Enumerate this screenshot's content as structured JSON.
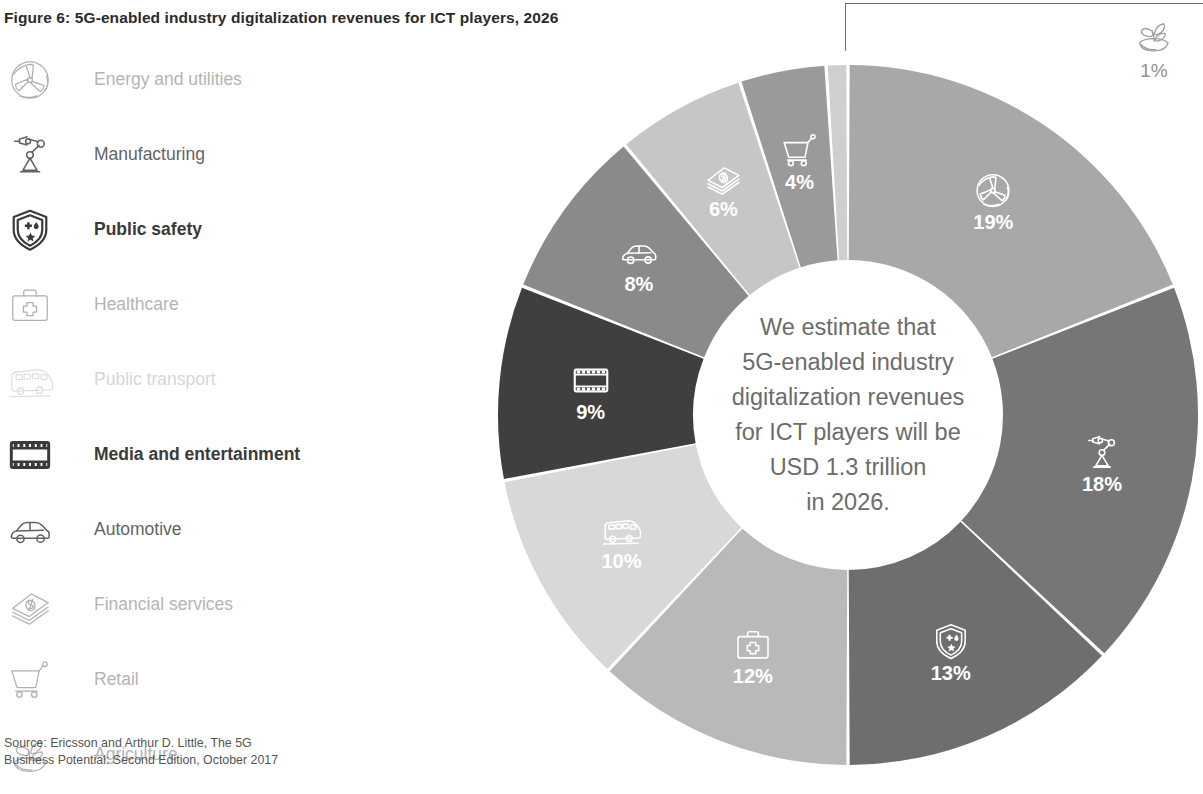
{
  "figure": {
    "title": "Figure 6: 5G-enabled industry digitalization revenues for ICT players, 2026",
    "source": "Source: Ericsson and Arthur D. Little, The 5G\nBusiness Potential: Second Edition, October 2017"
  },
  "center": {
    "line1": "We estimate that",
    "line2": "5G-enabled industry",
    "line3": "digitalization revenues",
    "line4": "for ICT players will be",
    "line5": "USD 1.3 trillion",
    "line6": "in 2026."
  },
  "legend": {
    "items": [
      {
        "label": "Energy and utilities",
        "icon": "wind-turbine-icon",
        "emphasis": "light"
      },
      {
        "label": "Manufacturing",
        "icon": "robot-arm-icon",
        "emphasis": "medium"
      },
      {
        "label": "Public safety",
        "icon": "shield-icon",
        "emphasis": "strong"
      },
      {
        "label": "Healthcare",
        "icon": "first-aid-kit-icon",
        "emphasis": "light"
      },
      {
        "label": "Public transport",
        "icon": "bus-icon",
        "emphasis": "faint"
      },
      {
        "label": "Media and entertainment",
        "icon": "film-strip-icon",
        "emphasis": "strong"
      },
      {
        "label": "Automotive",
        "icon": "car-icon",
        "emphasis": "medium"
      },
      {
        "label": "Financial services",
        "icon": "banknotes-icon",
        "emphasis": "light"
      },
      {
        "label": "Retail",
        "icon": "shopping-cart-icon",
        "emphasis": "light"
      },
      {
        "label": "Agriculture",
        "icon": "seedling-icon",
        "emphasis": "light"
      }
    ]
  },
  "chart_data": {
    "type": "pie",
    "variant": "donut",
    "title": "Figure 6: 5G-enabled industry digitalization revenues for ICT players, 2026",
    "unit": "percent",
    "total_label": "USD 1.3 trillion",
    "year": "2026",
    "start_angle_deg": 0,
    "direction": "clockwise",
    "inner_radius_ratio": 0.44,
    "legend_position": "left",
    "grid": false,
    "categories": [
      "Energy and utilities",
      "Manufacturing",
      "Public safety",
      "Healthcare",
      "Public transport",
      "Media and entertainment",
      "Automotive",
      "Financial services",
      "Retail",
      "Agriculture"
    ],
    "values": [
      19,
      18,
      13,
      12,
      10,
      9,
      8,
      6,
      4,
      1
    ],
    "labels": [
      "19%",
      "18%",
      "13%",
      "12%",
      "10%",
      "9%",
      "8%",
      "6%",
      "4%",
      "1%"
    ],
    "colors": [
      "#a8a8a8",
      "#767676",
      "#6e6e6e",
      "#b9b9b9",
      "#d8d8d8",
      "#3f3f3f",
      "#8a8a8a",
      "#c6c6c6",
      "#9a9a9a",
      "#cfcfcf"
    ],
    "icons": [
      "wind-turbine-icon",
      "robot-arm-icon",
      "shield-icon",
      "first-aid-kit-icon",
      "bus-icon",
      "film-strip-icon",
      "car-icon",
      "banknotes-icon",
      "shopping-cart-icon",
      "seedling-icon"
    ],
    "slices": [
      {
        "name": "Energy and utilities",
        "value": 19,
        "label": "19%",
        "color": "#a8a8a8",
        "icon": "wind-turbine-icon",
        "label_inside": true
      },
      {
        "name": "Manufacturing",
        "value": 18,
        "label": "18%",
        "color": "#767676",
        "icon": "robot-arm-icon",
        "label_inside": true
      },
      {
        "name": "Public safety",
        "value": 13,
        "label": "13%",
        "color": "#6e6e6e",
        "icon": "shield-icon",
        "label_inside": true
      },
      {
        "name": "Healthcare",
        "value": 12,
        "label": "12%",
        "color": "#b9b9b9",
        "icon": "first-aid-kit-icon",
        "label_inside": true
      },
      {
        "name": "Public transport",
        "value": 10,
        "label": "10%",
        "color": "#d8d8d8",
        "icon": "bus-icon",
        "label_inside": true
      },
      {
        "name": "Media and entertainment",
        "value": 9,
        "label": "9%",
        "color": "#3f3f3f",
        "icon": "film-strip-icon",
        "label_inside": true
      },
      {
        "name": "Automotive",
        "value": 8,
        "label": "8%",
        "color": "#8a8a8a",
        "icon": "car-icon",
        "label_inside": true
      },
      {
        "name": "Financial services",
        "value": 6,
        "label": "6%",
        "color": "#c6c6c6",
        "icon": "banknotes-icon",
        "label_inside": true
      },
      {
        "name": "Retail",
        "value": 4,
        "label": "4%",
        "color": "#9a9a9a",
        "icon": "shopping-cart-icon",
        "label_inside": true
      },
      {
        "name": "Agriculture",
        "value": 1,
        "label": "1%",
        "color": "#cfcfcf",
        "icon": "seedling-icon",
        "label_inside": false
      }
    ]
  }
}
